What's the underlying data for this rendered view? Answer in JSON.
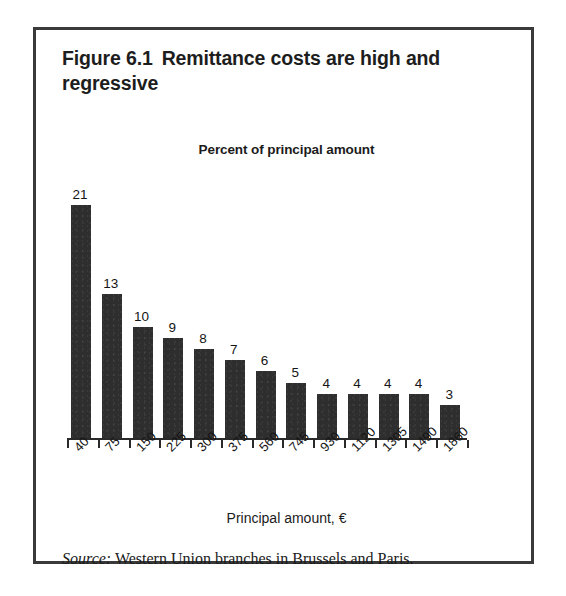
{
  "figure": {
    "number": "Figure 6.1",
    "title": "Remittance costs are high and regressive"
  },
  "chart_data": {
    "type": "bar",
    "subtitle": "Percent of principal amount",
    "xlabel": "Principal amount, €",
    "ylabel": "Percent of principal amount",
    "categories": [
      "40",
      "75",
      "150",
      "225",
      "300",
      "375",
      "560",
      "745",
      "930",
      "1120",
      "1305",
      "1490",
      "1860"
    ],
    "values": [
      21,
      13,
      10,
      9,
      8,
      7,
      6,
      5,
      4,
      4,
      4,
      4,
      3
    ],
    "data_labels": [
      "21",
      "13",
      "10",
      "9",
      "8",
      "7",
      "6",
      "5",
      "4",
      "4",
      "4",
      "4",
      "3"
    ],
    "ylim": [
      0,
      23
    ],
    "grid": false,
    "legend": null,
    "bar_color": "#2e2e2e",
    "axis_color": "#2a2a2a",
    "rotated_tick_labels": true,
    "tick_label_rotation_deg": -45
  },
  "source": {
    "label": "Source:",
    "text": "Western Union branches in Brussels and Paris."
  },
  "colors": {
    "bar": "#2e2e2e",
    "frame": "#3a3a3a",
    "background": "#ffffff",
    "text": "#1b1b1b"
  }
}
